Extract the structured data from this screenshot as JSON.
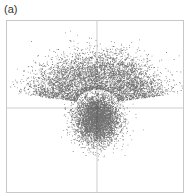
{
  "panel": {
    "label": "(a)"
  },
  "chart_data": {
    "type": "scatter",
    "title": "",
    "panel_label": "(a)",
    "xlabel": "",
    "ylabel": "",
    "grid": false,
    "crosshair": {
      "x_center": true,
      "y_center": true,
      "color": "#c0c0c0"
    },
    "xlim": [
      -1,
      1
    ],
    "ylim": [
      -1,
      1
    ],
    "point_color": "#000000",
    "clusters": [
      {
        "name": "upper-arc",
        "shape": "annulus-sector",
        "center": [
          0.0,
          -0.05
        ],
        "radius_mean": 0.45,
        "radius_sd": 0.16,
        "angle_range_deg": [
          10,
          170
        ],
        "count": 9000
      },
      {
        "name": "central-blob",
        "shape": "gaussian",
        "center": [
          0.0,
          -0.12
        ],
        "sd": [
          0.12,
          0.14
        ],
        "count": 5000
      }
    ]
  }
}
